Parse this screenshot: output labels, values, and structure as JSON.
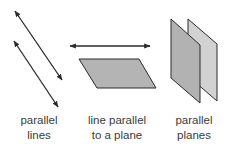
{
  "figure": {
    "panels": [
      {
        "id": "parallel-lines",
        "label_line1": "parallel",
        "label_line2": "lines"
      },
      {
        "id": "line-parallel-plane",
        "label_line1": "line parallel",
        "label_line2": "to a plane"
      },
      {
        "id": "parallel-planes",
        "label_line1": "parallel",
        "label_line2": "planes"
      }
    ],
    "colors": {
      "stroke": "#2a2a2a",
      "plane_fill": "#b4b4b4",
      "front_plane_fill": "#b2b2b2",
      "back_plane_fill": "#d2d2d2",
      "text": "#3a3a3a"
    }
  }
}
